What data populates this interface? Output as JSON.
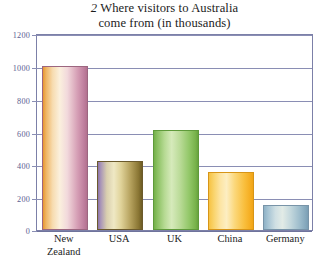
{
  "chart_data": {
    "type": "bar",
    "title": "Where visitors to Australia come from (in thousands)",
    "title_number": "2",
    "title_line1": "Where visitors to Australia",
    "title_line2": "come from (in thousands)",
    "xlabel": "",
    "ylabel": "",
    "ylim": [
      0,
      1200
    ],
    "ytick_step": 200,
    "grid": true,
    "legend": "none",
    "categories": [
      "New Zealand",
      "USA",
      "UK",
      "China",
      "Germany"
    ],
    "category_lines": [
      [
        "New",
        "Zealand"
      ],
      [
        "USA"
      ],
      [
        "UK"
      ],
      [
        "China"
      ],
      [
        "Germany"
      ]
    ],
    "values": [
      1000,
      420,
      610,
      355,
      155
    ],
    "ytick_labels": [
      "0",
      "200",
      "400",
      "600",
      "800",
      "1000",
      "1200"
    ],
    "ytick_values": [
      0,
      200,
      400,
      600,
      800,
      1000,
      1200
    ],
    "bar_colors": [
      "#d39ab2",
      "#b5a15d",
      "#92c768",
      "#f9bf3e",
      "#9fbecd"
    ],
    "axis_color": "#7c80a8",
    "gridline_color": "#8a8eb4",
    "tick_label_color": "#5c6091",
    "category_label_color": "#1c1c1c",
    "plot_background": "#ffffff"
  }
}
